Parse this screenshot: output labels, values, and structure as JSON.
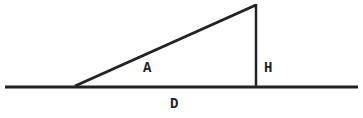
{
  "diagram": {
    "type": "right-triangle-on-baseline",
    "labels": {
      "angle": "A",
      "height": "H",
      "distance": "D"
    },
    "colors": {
      "stroke": "#222222",
      "background": "#ffffff"
    }
  }
}
